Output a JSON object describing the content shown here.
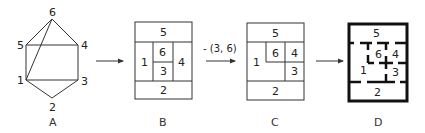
{
  "panels": [
    {
      "caption": "A",
      "kind": "graph",
      "nodes": [
        {
          "id": "1",
          "x": 26,
          "y": 80
        },
        {
          "id": "2",
          "x": 52,
          "y": 98
        },
        {
          "id": "3",
          "x": 78,
          "y": 80
        },
        {
          "id": "4",
          "x": 78,
          "y": 45
        },
        {
          "id": "5",
          "x": 26,
          "y": 45
        },
        {
          "id": "6",
          "x": 52,
          "y": 19
        }
      ],
      "edges": [
        [
          "6",
          "5"
        ],
        [
          "6",
          "4"
        ],
        [
          "6",
          "1"
        ],
        [
          "5",
          "4"
        ],
        [
          "5",
          "1"
        ],
        [
          "4",
          "3"
        ],
        [
          "1",
          "3"
        ],
        [
          "1",
          "2"
        ],
        [
          "3",
          "2"
        ]
      ]
    },
    {
      "caption": "B",
      "kind": "floorplan",
      "rooms": [
        "5",
        "1",
        "6",
        "3",
        "4",
        "2"
      ]
    },
    {
      "caption": "C",
      "kind": "floorplan",
      "rooms": [
        "5",
        "1",
        "6",
        "4",
        "3",
        "2"
      ]
    },
    {
      "caption": "D",
      "kind": "floorplan-walls",
      "rooms": [
        "5",
        "6",
        "4",
        "1",
        "3",
        "2"
      ]
    }
  ],
  "arrows": [
    {
      "label": ""
    },
    {
      "label": "- (3, 6)"
    },
    {
      "label": ""
    }
  ],
  "labels": {
    "a": {
      "n1": "1",
      "n2": "2",
      "n3": "3",
      "n4": "4",
      "n5": "5",
      "n6": "6",
      "cap": "A"
    },
    "b": {
      "r5": "5",
      "r1": "1",
      "r6": "6",
      "r3": "3",
      "r4": "4",
      "r2": "2",
      "cap": "B"
    },
    "c": {
      "r5": "5",
      "r1": "1",
      "r6": "6",
      "r4": "4",
      "r3": "3",
      "r2": "2",
      "cap": "C"
    },
    "d": {
      "r5": "5",
      "r6": "6",
      "r4": "4",
      "r1": "1",
      "r3": "3",
      "r2": "2",
      "cap": "D"
    },
    "arrow2": "- (3, 6)"
  }
}
